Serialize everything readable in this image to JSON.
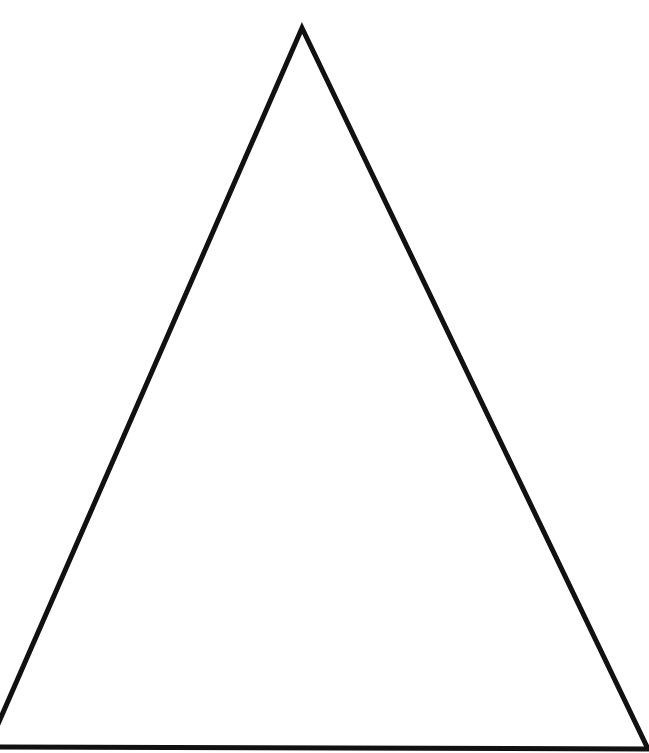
{
  "diagram": {
    "shape": "triangle",
    "type": "isosceles-outline",
    "fill": "none",
    "background_color": "#ffffff",
    "stroke_color": "#111111",
    "stroke_width": 5,
    "vertices": {
      "apex": [
        302,
        28
      ],
      "bottom_left": [
        -12,
        747
      ],
      "bottom_right": [
        648,
        749
      ]
    }
  }
}
